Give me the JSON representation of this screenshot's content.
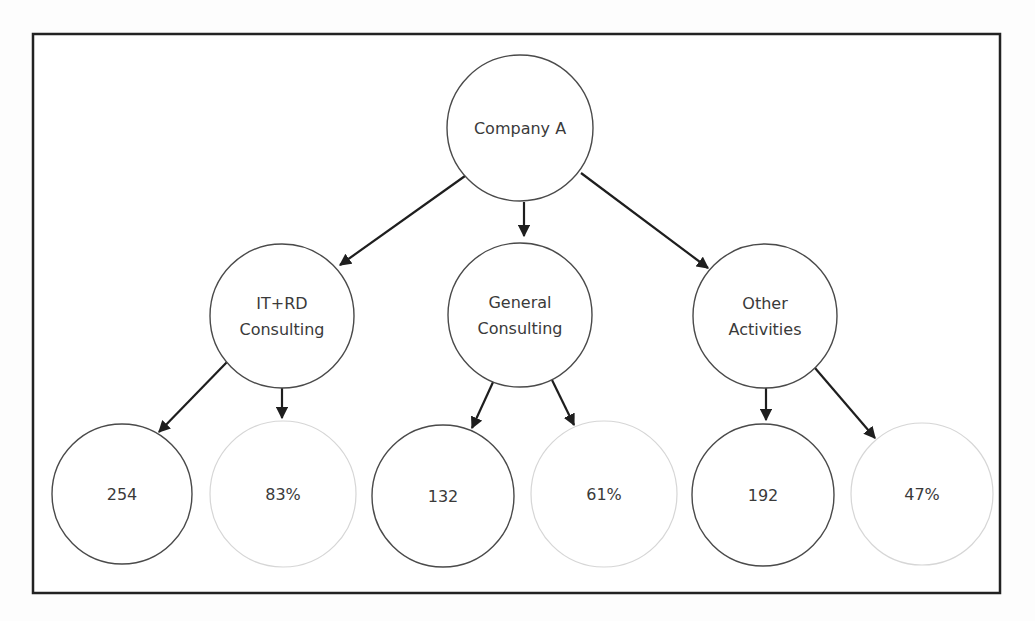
{
  "frame": {
    "x": 33,
    "y": 34,
    "width": 967,
    "height": 559,
    "stroke": "#222222"
  },
  "colors": {
    "node_stroke": "#4a4a4a",
    "faint_node_stroke": "#d6d6d6",
    "arrow": "#1e1e1e",
    "text": "#3a3a3a"
  },
  "nodes": [
    {
      "id": "company-a",
      "lines": [
        "Company A"
      ],
      "cx": 520,
      "cy": 128,
      "r": 73,
      "faint": false,
      "level": 1
    },
    {
      "id": "it-rd-consulting",
      "lines": [
        "IT+RD",
        "Consulting"
      ],
      "cx": 282,
      "cy": 316,
      "r": 72,
      "faint": false,
      "level": 2
    },
    {
      "id": "general-consulting",
      "lines": [
        "General",
        "Consulting"
      ],
      "cx": 520,
      "cy": 315,
      "r": 72,
      "faint": false,
      "level": 2
    },
    {
      "id": "other-activities",
      "lines": [
        "Other",
        "Activities"
      ],
      "cx": 765,
      "cy": 316,
      "r": 72,
      "faint": false,
      "level": 2
    },
    {
      "id": "it-rd-count",
      "lines": [
        "254"
      ],
      "cx": 122,
      "cy": 494,
      "r": 70,
      "faint": false,
      "level": 3
    },
    {
      "id": "it-rd-percent",
      "lines": [
        "83%"
      ],
      "cx": 283,
      "cy": 494,
      "r": 73,
      "faint": true,
      "level": 3
    },
    {
      "id": "general-count",
      "lines": [
        "132"
      ],
      "cx": 443,
      "cy": 496,
      "r": 71,
      "faint": false,
      "level": 3
    },
    {
      "id": "general-percent",
      "lines": [
        "61%"
      ],
      "cx": 604,
      "cy": 494,
      "r": 73,
      "faint": true,
      "level": 3
    },
    {
      "id": "other-count",
      "lines": [
        "192"
      ],
      "cx": 763,
      "cy": 495,
      "r": 71,
      "faint": false,
      "level": 3
    },
    {
      "id": "other-percent",
      "lines": [
        "47%"
      ],
      "cx": 922,
      "cy": 494,
      "r": 71,
      "faint": true,
      "level": 3
    }
  ],
  "edges": [
    {
      "from": "company-a",
      "to": "it-rd-consulting",
      "x1": 465,
      "y1": 176,
      "x2": 340,
      "y2": 265
    },
    {
      "from": "company-a",
      "to": "general-consulting",
      "x1": 524,
      "y1": 202,
      "x2": 524,
      "y2": 236
    },
    {
      "from": "company-a",
      "to": "other-activities",
      "x1": 581,
      "y1": 173,
      "x2": 708,
      "y2": 268
    },
    {
      "from": "it-rd-consulting",
      "to": "it-rd-count",
      "x1": 227,
      "y1": 362,
      "x2": 159,
      "y2": 432
    },
    {
      "from": "it-rd-consulting",
      "to": "it-rd-percent",
      "x1": 282,
      "y1": 388,
      "x2": 282,
      "y2": 418
    },
    {
      "from": "general-consulting",
      "to": "general-count",
      "x1": 494,
      "y1": 380,
      "x2": 472,
      "y2": 428
    },
    {
      "from": "general-consulting",
      "to": "general-percent",
      "x1": 552,
      "y1": 380,
      "x2": 574,
      "y2": 425
    },
    {
      "from": "other-activities",
      "to": "other-count",
      "x1": 766,
      "y1": 387,
      "x2": 766,
      "y2": 420
    },
    {
      "from": "other-activities",
      "to": "other-percent",
      "x1": 815,
      "y1": 368,
      "x2": 875,
      "y2": 438
    }
  ]
}
